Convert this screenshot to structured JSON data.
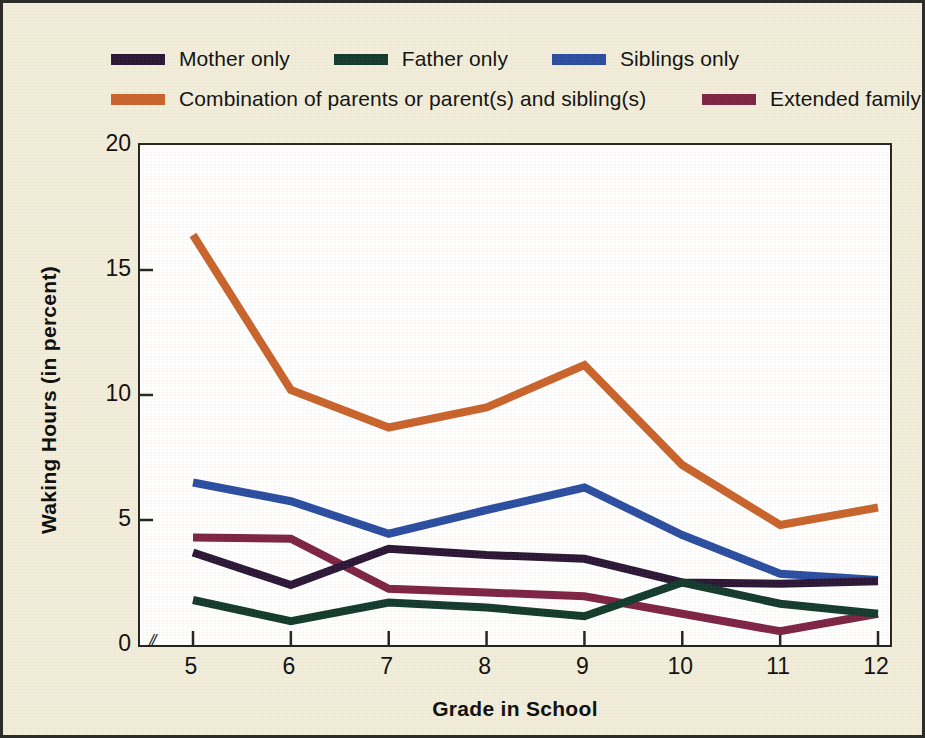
{
  "figure": {
    "background_color": "#f2eedb",
    "plot_background_color": "#ffffff",
    "border_color": "#2c2c28"
  },
  "axes": {
    "x_title": "Grade in School",
    "y_title": "Waking Hours (in percent)",
    "x_ticks": [
      "5",
      "6",
      "7",
      "8",
      "9",
      "10",
      "11",
      "12"
    ],
    "y_ticks": [
      "0",
      "5",
      "10",
      "15",
      "20"
    ],
    "axis_break_marker": "//"
  },
  "legend": {
    "row1": [
      {
        "label": "Mother only",
        "color": "#2b1636"
      },
      {
        "label": "Father only",
        "color": "#133a2c"
      },
      {
        "label": "Siblings only",
        "color": "#2b4da0"
      }
    ],
    "row2": [
      {
        "label": "Combination of parents or parent(s) and sibling(s)",
        "color": "#c8632c"
      },
      {
        "label": "Extended family",
        "color": "#7d2343"
      }
    ]
  },
  "chart_data": {
    "type": "line",
    "title": "",
    "xlabel": "Grade in School",
    "ylabel": "Waking Hours (in percent)",
    "categories": [
      5,
      6,
      7,
      8,
      9,
      10,
      11,
      12
    ],
    "xlim": [
      5,
      12
    ],
    "ylim": [
      0,
      20
    ],
    "yticks": [
      0,
      5,
      10,
      15,
      20
    ],
    "grid": false,
    "legend_position": "top",
    "series": [
      {
        "name": "Mother only",
        "color": "#2b1636",
        "values": [
          3.7,
          2.4,
          3.85,
          3.6,
          3.45,
          2.5,
          2.45,
          2.55
        ]
      },
      {
        "name": "Father only",
        "color": "#133a2c",
        "values": [
          1.8,
          0.95,
          1.7,
          1.5,
          1.15,
          2.5,
          1.65,
          1.25
        ]
      },
      {
        "name": "Siblings only",
        "color": "#2b4da0",
        "values": [
          6.5,
          5.75,
          4.45,
          5.4,
          6.3,
          4.4,
          2.85,
          2.6
        ]
      },
      {
        "name": "Combination of parents or parent(s) and sibling(s)",
        "color": "#c8632c",
        "values": [
          16.4,
          10.2,
          8.7,
          9.5,
          11.2,
          7.2,
          4.8,
          5.5
        ]
      },
      {
        "name": "Extended family",
        "color": "#7d2343",
        "values": [
          4.3,
          4.25,
          2.25,
          2.1,
          1.95,
          1.25,
          0.55,
          1.25
        ]
      }
    ]
  }
}
